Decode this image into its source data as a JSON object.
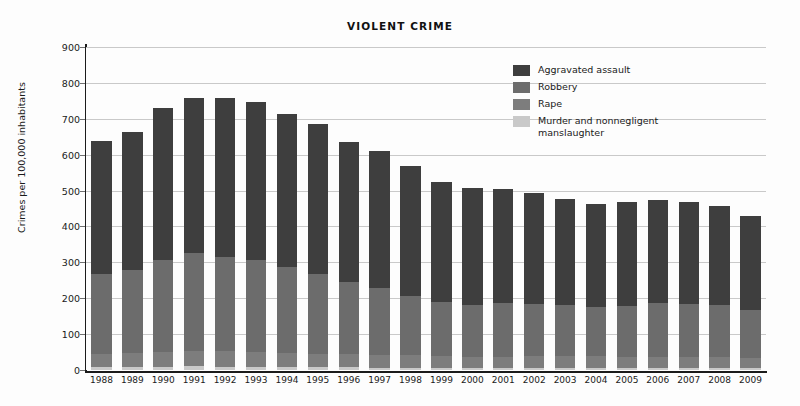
{
  "chart_data": {
    "type": "bar",
    "subtype": "stacked-bar",
    "title": "VIOLENT CRIME",
    "xlabel": "",
    "ylabel": "Crimes per 100,000 inhabitants",
    "ylim": [
      0,
      900
    ],
    "ytick_step": 100,
    "yticks": [
      0,
      100,
      200,
      300,
      400,
      500,
      600,
      700,
      800,
      900
    ],
    "grid": true,
    "legend_position": "top-right",
    "categories": [
      "1988",
      "1989",
      "1990",
      "1991",
      "1992",
      "1993",
      "1994",
      "1995",
      "1996",
      "1997",
      "1998",
      "1999",
      "2000",
      "2001",
      "2002",
      "2003",
      "2004",
      "2005",
      "2006",
      "2007",
      "2008",
      "2009"
    ],
    "series": [
      {
        "name": "Murder and nonnegligent manslaughter",
        "color": "#c9c9c9",
        "values": [
          8.4,
          8.7,
          9.4,
          9.8,
          9.3,
          9.5,
          9.0,
          8.2,
          7.4,
          6.8,
          6.3,
          5.7,
          5.5,
          5.6,
          5.6,
          5.7,
          5.5,
          5.6,
          5.7,
          5.6,
          5.4,
          5.0
        ]
      },
      {
        "name": "Rape",
        "color": "#7d7d7d",
        "values": [
          37.6,
          38.1,
          41.1,
          42.3,
          42.8,
          41.1,
          39.3,
          37.1,
          36.3,
          35.9,
          34.5,
          32.8,
          32.0,
          31.8,
          33.1,
          32.3,
          32.4,
          31.8,
          31.6,
          30.6,
          29.8,
          29.1
        ]
      },
      {
        "name": "Robbery",
        "color": "#6c6c6c",
        "values": [
          220.9,
          233.0,
          257.0,
          272.7,
          263.6,
          255.9,
          237.7,
          220.9,
          201.9,
          186.2,
          165.5,
          150.1,
          145.0,
          148.5,
          146.1,
          142.5,
          136.7,
          140.7,
          149.4,
          147.6,
          145.9,
          133.0
        ]
      },
      {
        "name": "Aggravated assault",
        "color": "#3e3e3e",
        "values": [
          370.2,
          383.4,
          422.9,
          433.3,
          441.8,
          440.5,
          427.6,
          418.3,
          391.0,
          382.1,
          361.4,
          334.3,
          324.0,
          318.6,
          309.5,
          295.4,
          288.6,
          290.8,
          287.5,
          283.8,
          274.6,
          262.8
        ]
      }
    ],
    "totals": [
      637.1,
      663.2,
      730.4,
      758.1,
      757.5,
      747.0,
      713.6,
      684.5,
      636.6,
      611.0,
      567.7,
      522.9,
      506.5,
      504.5,
      494.3,
      475.9,
      463.2,
      468.9,
      474.2,
      467.6,
      455.7,
      429.9
    ]
  },
  "legend": {
    "items": [
      {
        "label": "Aggravated assault",
        "color": "#3e3e3e"
      },
      {
        "label": "Robbery",
        "color": "#6c6c6c"
      },
      {
        "label": "Rape",
        "color": "#7d7d7d"
      },
      {
        "label": "Murder and nonnegligent\n  manslaughter",
        "color": "#c9c9c9"
      }
    ]
  }
}
